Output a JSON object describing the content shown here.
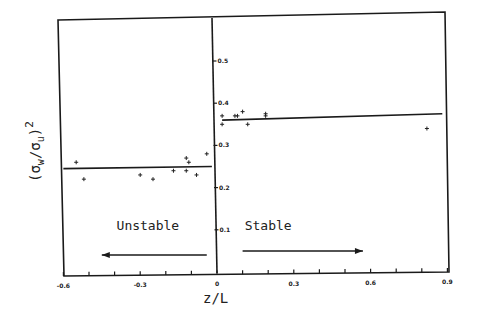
{
  "chart_data": {
    "type": "scatter",
    "title": "",
    "xlabel": "z/L",
    "ylabel": "(σw/σu)²",
    "ylabel_parts": {
      "open": "(σ",
      "sub1": "w",
      "slash": "/σ",
      "sub2": "u",
      "close": ")",
      "sup": "2"
    },
    "xlim": [
      -0.6,
      0.9
    ],
    "ylim": [
      0.0,
      0.55
    ],
    "grid": false,
    "legend": null,
    "x_ticks": [
      -0.6,
      -0.3,
      0,
      0.3,
      0.6,
      0.9
    ],
    "x_tick_labels": [
      "-0.6",
      "-0.3",
      "0",
      "0.3",
      "0.6",
      "0.9"
    ],
    "x_minor_ticks": [
      -0.5,
      -0.4,
      -0.2,
      -0.1,
      0.1,
      0.2,
      0.4,
      0.5,
      0.7,
      0.8
    ],
    "y_ticks": [
      0.1,
      0.2,
      0.3,
      0.4,
      0.5
    ],
    "y_tick_labels": [
      "0.1",
      "0.2",
      "0.3",
      "0.4",
      "0.5"
    ],
    "series": [
      {
        "name": "Unstable observations",
        "marker": "+",
        "points": [
          [
            -0.55,
            0.26
          ],
          [
            -0.52,
            0.22
          ],
          [
            -0.3,
            0.23
          ],
          [
            -0.25,
            0.22
          ],
          [
            -0.17,
            0.24
          ],
          [
            -0.12,
            0.27
          ],
          [
            -0.11,
            0.26
          ],
          [
            -0.12,
            0.24
          ],
          [
            -0.08,
            0.23
          ],
          [
            -0.04,
            0.28
          ]
        ]
      },
      {
        "name": "Stable observations",
        "marker": "+",
        "points": [
          [
            0.02,
            0.37
          ],
          [
            0.02,
            0.35
          ],
          [
            0.07,
            0.37
          ],
          [
            0.08,
            0.37
          ],
          [
            0.1,
            0.38
          ],
          [
            0.12,
            0.35
          ],
          [
            0.19,
            0.37
          ],
          [
            0.19,
            0.375
          ],
          [
            0.82,
            0.34
          ]
        ]
      }
    ],
    "fit_lines": [
      {
        "name": "Unstable mean",
        "x": [
          -0.6,
          -0.02
        ],
        "y": [
          0.245,
          0.25
        ]
      },
      {
        "name": "Stable mean",
        "x": [
          0.02,
          0.88
        ],
        "y": [
          0.36,
          0.375
        ]
      }
    ],
    "annotations": [
      {
        "text": "Unstable",
        "x": -0.27,
        "y": 0.1,
        "arrow_from": -0.04,
        "arrow_to": -0.45,
        "arrow_y": 0.04
      },
      {
        "text": "Stable",
        "x": 0.2,
        "y": 0.1,
        "arrow_from": 0.1,
        "arrow_to": 0.57,
        "arrow_y": 0.05
      }
    ]
  }
}
